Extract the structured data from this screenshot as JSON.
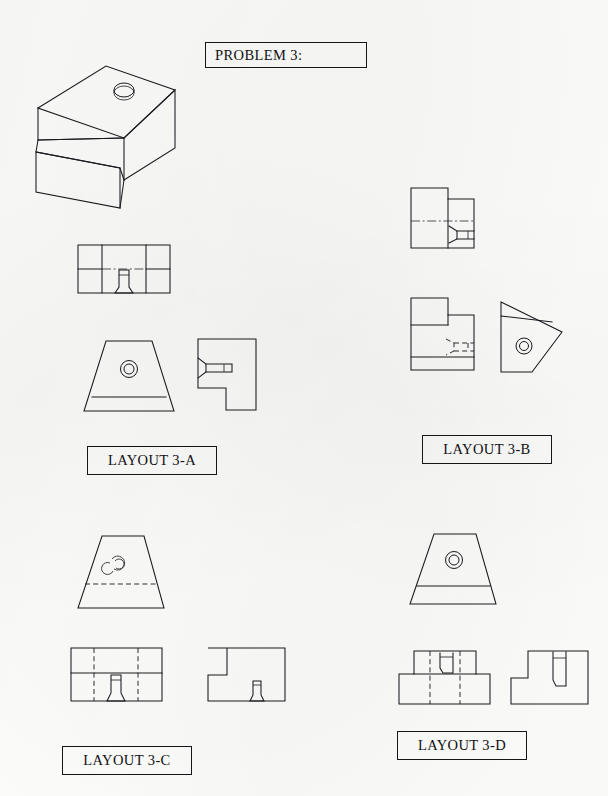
{
  "document": {
    "kind": "engineering-multiview-worksheet",
    "page_width": 608,
    "page_height": 796,
    "background_color": "#fdfdfb",
    "line_color": "#1a1a1f"
  },
  "problem": {
    "title": "PROBLEM 3:",
    "box": {
      "x": 205,
      "y": 42,
      "w": 162,
      "h": 26
    }
  },
  "pictorial": {
    "name": "isometric-stepped-block",
    "description": "Isometric pictorial of a stepped block with a sloped upper face and a counterbored hole",
    "features": [
      "step",
      "sloped-face",
      "counterbored-hole"
    ],
    "box": {
      "x": 28,
      "y": 55,
      "w": 160,
      "h": 125
    }
  },
  "layouts": [
    {
      "id": "3-A",
      "label": "LAYOUT 3-A",
      "label_box": {
        "x": 87,
        "y": 446,
        "w": 128,
        "h": 27
      },
      "views": [
        {
          "name": "top-view",
          "shape": "stepped-rectangle-with-hole",
          "hole": "counterbore-profile"
        },
        {
          "name": "front-view",
          "shape": "trapezoid-with-base-band",
          "hole": "concentric-circles"
        },
        {
          "name": "side-view",
          "shape": "notched-square",
          "hole": "counterbore-profile-horizontal"
        }
      ]
    },
    {
      "id": "3-B",
      "label": "LAYOUT 3-B",
      "label_box": {
        "x": 422,
        "y": 435,
        "w": 128,
        "h": 27
      },
      "views": [
        {
          "name": "upper-view",
          "shape": "stepped-rectangle",
          "hole": "counterbore-profile-horizontal",
          "centerline": true
        },
        {
          "name": "lower-view",
          "shape": "stepped-rectangle-with-band",
          "hole": "counterbore-hidden-horizontal"
        },
        {
          "name": "rotated-view",
          "shape": "rotated-trapezoid",
          "hole": "concentric-circles"
        }
      ]
    },
    {
      "id": "3-C",
      "label": "LAYOUT 3-C",
      "label_box": {
        "x": 62,
        "y": 746,
        "w": 128,
        "h": 27
      },
      "views": [
        {
          "name": "top-view",
          "shape": "trapezoid-with-dashed-band",
          "hole": "partial-arcs"
        },
        {
          "name": "front-view",
          "shape": "stepped-rectangle-dashed",
          "hole": "counterbore-profile"
        },
        {
          "name": "side-view",
          "shape": "notched-rectangle",
          "hole": "counterbore-profile"
        }
      ]
    },
    {
      "id": "3-D",
      "label": "LAYOUT 3-D",
      "label_box": {
        "x": 397,
        "y": 731,
        "w": 128,
        "h": 27
      },
      "views": [
        {
          "name": "top-view",
          "shape": "trapezoid-with-base-band",
          "hole": "concentric-circles"
        },
        {
          "name": "front-view",
          "shape": "stepped-rectangle-dashed",
          "hole": "counterbore-profile"
        },
        {
          "name": "side-view",
          "shape": "notched-rectangle",
          "hole": "counterbore-profile"
        }
      ]
    }
  ]
}
